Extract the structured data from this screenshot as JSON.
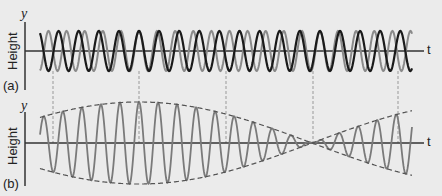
{
  "panel_a": {
    "label": "(a)",
    "y_axis_label": "y",
    "y_title": "Height",
    "x_axis_label": "t",
    "axis_y": 51,
    "amplitude": 20,
    "wave1": {
      "color": "#1a1a1a",
      "period": 20.1,
      "stroke": 2.2
    },
    "wave2": {
      "color": "#8a8a8a",
      "period": 18.1,
      "stroke": 2.0
    }
  },
  "panel_b": {
    "label": "(b)",
    "y_axis_label": "y",
    "y_title": "Height",
    "x_axis_label": "t",
    "axis_y": 143,
    "amplitude": 41,
    "wave_color": "#7a7a7a",
    "envelope_color": "#555555"
  },
  "beat": {
    "nodes_x": [
      53,
      226,
      398
    ],
    "antinodes_x": [
      139,
      313
    ],
    "dashed_lines_x": [
      53,
      139,
      226,
      313,
      398
    ]
  },
  "colors": {
    "background": "#ebebeb",
    "axis": "#333333",
    "dashed": "#999999"
  }
}
